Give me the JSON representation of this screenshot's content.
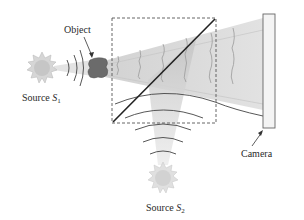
{
  "diagram": {
    "labels": {
      "object": "Object",
      "source1_prefix": "Source ",
      "source1_symbol": "S",
      "source1_sub": "1",
      "source2_prefix": "Source ",
      "source2_symbol": "S",
      "source2_sub": "2",
      "camera": "Camera"
    },
    "colors": {
      "beam": "#d8d8d8",
      "beam_dark": "#bdbdbd",
      "object": "#6b6b6b",
      "sun": "#cfcfcf",
      "line": "#222222",
      "dashed_box": "#555555",
      "camera_fill": "#f4f4f4",
      "camera_stroke": "#666666"
    }
  }
}
